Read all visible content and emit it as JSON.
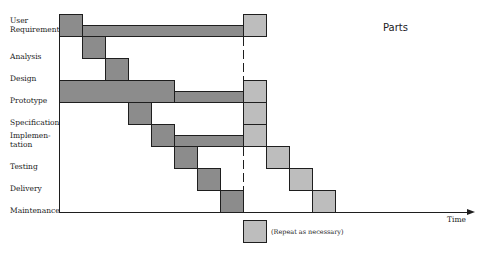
{
  "title": "Parts",
  "axis": {
    "x_label": "Time"
  },
  "legend": {
    "label": "(Repeat as necessary)",
    "color": "#bdbdbd"
  },
  "colors": {
    "phase": "#8c8c8c",
    "repeat": "#bdbdbd",
    "stroke": "#1e1e1e"
  },
  "rows": [
    {
      "label_line1": "User",
      "label_line2": "Requirements"
    },
    {
      "label_line1": "Analysis",
      "label_line2": ""
    },
    {
      "label_line1": "Design",
      "label_line2": ""
    },
    {
      "label_line1": "Prototype",
      "label_line2": ""
    },
    {
      "label_line1": "Specification",
      "label_line2": ""
    },
    {
      "label_line1": "Implemen-",
      "label_line2": "tation"
    },
    {
      "label_line1": "Testing",
      "label_line2": ""
    },
    {
      "label_line1": "Delivery",
      "label_line2": ""
    },
    {
      "label_line1": "Maintenance",
      "label_line2": ""
    }
  ]
}
